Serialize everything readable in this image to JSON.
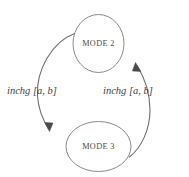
{
  "diagram": {
    "background_color": "#ffffff",
    "node_stroke_color": "#8a8a8a",
    "edge_stroke_color": "#6e6e6e",
    "text_color": "#4a4a4a",
    "nodes": [
      {
        "id": "mode2",
        "label": "MODE 2",
        "shape": "ellipse",
        "cx": 98.5,
        "cy": 43.5,
        "rx": 25.5,
        "ry": 29.0
      },
      {
        "id": "mode3",
        "label": "MODE 3",
        "shape": "ellipse",
        "cx": 98.5,
        "cy": 146.5,
        "rx": 32.5,
        "ry": 25.0
      }
    ],
    "edges": [
      {
        "id": "edge-mode2-to-mode3",
        "from": "mode2",
        "to": "mode3",
        "label": "inchg [a, b]",
        "direction": "downward",
        "side": "left",
        "arrow_at": "mode3"
      },
      {
        "id": "edge-mode3-to-mode2",
        "from": "mode3",
        "to": "mode2",
        "label": "inchg [a, b]",
        "direction": "upward",
        "side": "right",
        "arrow_at": "mode2"
      }
    ]
  }
}
